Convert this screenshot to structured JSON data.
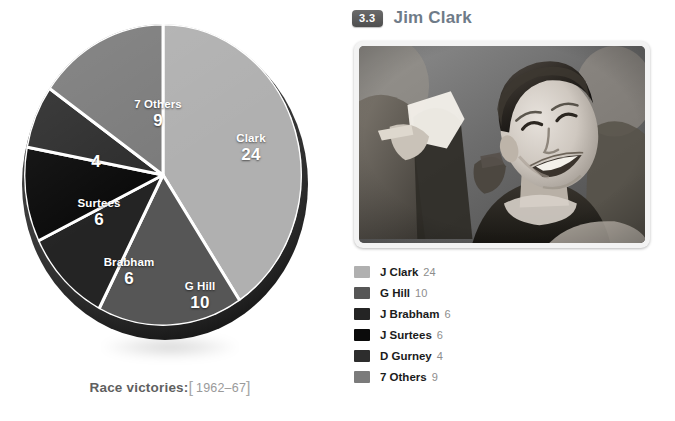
{
  "chart_data": {
    "type": "pie",
    "title": "Race victories:",
    "subtitle": "1962–67",
    "categories": [
      "Clark",
      "G Hill",
      "Brabham",
      "Surtees",
      "D Gurney",
      "7 Others"
    ],
    "values": [
      24,
      10,
      6,
      6,
      4,
      9
    ],
    "total": 59,
    "legend_position": "right",
    "grid": false,
    "slices": [
      {
        "name": "Clark",
        "label": "Clark",
        "value": 24,
        "color": "#b0b0b0",
        "show_name": true
      },
      {
        "name": "G Hill",
        "label": "G Hill",
        "value": 10,
        "color": "#565656",
        "show_name": true
      },
      {
        "name": "Brabham",
        "label": "Brabham",
        "value": 6,
        "color": "#242424",
        "show_name": true
      },
      {
        "name": "Surtees",
        "label": "Surtees",
        "value": 6,
        "color": "#0b0b0b",
        "show_name": true
      },
      {
        "name": "D Gurney",
        "label": "",
        "value": 4,
        "color": "#2d2d2d",
        "show_name": false
      },
      {
        "name": "7 Others",
        "label": "7 Others",
        "value": 9,
        "color": "#7b7b7b",
        "show_name": true
      }
    ]
  },
  "caption": {
    "main": "Race victories:",
    "bracket_open": "[",
    "years": "1962–67",
    "bracket_close": "]"
  },
  "profile": {
    "section_number": "3.3",
    "name": "Jim Clark",
    "photo_alt": "Jim Clark smiling, black and white photograph"
  },
  "legend": {
    "items": [
      {
        "label": "J Clark",
        "value": "24",
        "color": "#b0b0b0"
      },
      {
        "label": "G Hill",
        "value": "10",
        "color": "#565656"
      },
      {
        "label": "J Brabham",
        "value": "6",
        "color": "#242424"
      },
      {
        "label": "J Surtees",
        "value": "6",
        "color": "#0b0b0b"
      },
      {
        "label": "D Gurney",
        "value": "4",
        "color": "#2d2d2d"
      },
      {
        "label": "7 Others",
        "value": "9",
        "color": "#7b7b7b"
      }
    ]
  },
  "colors": {
    "accent_name": "#6f7b88",
    "badge_bg": "#5a5a5a",
    "caption_main": "#5f5f5f",
    "caption_years": "#9a9a9a"
  }
}
